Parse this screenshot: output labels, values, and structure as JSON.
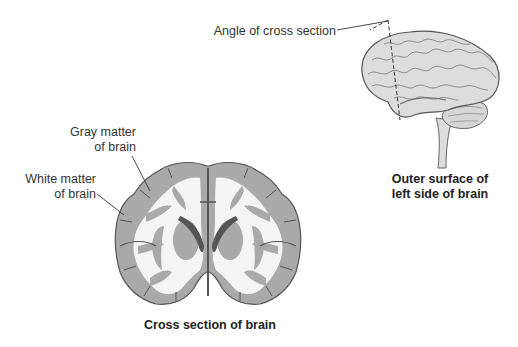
{
  "diagram": {
    "labels": {
      "angle": "Angle of cross section",
      "gray_matter_line1": "Gray matter",
      "gray_matter_line2": "of brain",
      "white_matter_line1": "White matter",
      "white_matter_line2": "of brain"
    },
    "captions": {
      "outer_line1": "Outer surface of",
      "outer_line2": "left side of brain",
      "cross_section": "Cross section of brain"
    },
    "colors": {
      "gray_matter": "#a9a9a9",
      "white_matter": "#f4f4f4",
      "outline": "#555555",
      "ventricle": "#555555",
      "brain_surface": "#d9d9d9"
    }
  }
}
